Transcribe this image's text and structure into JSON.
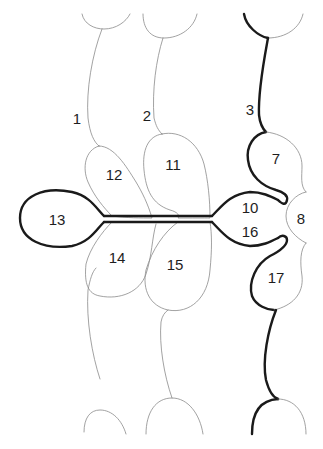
{
  "diagram": {
    "colors": {
      "background": "#ffffff",
      "thin_line": "#8a8a8a",
      "thick_line": "#1a1a1a",
      "label": "#1e1e1e"
    },
    "labels": [
      {
        "id": "1",
        "text": "1",
        "x": 77,
        "y": 118
      },
      {
        "id": "2",
        "text": "2",
        "x": 147,
        "y": 115
      },
      {
        "id": "3",
        "text": "3",
        "x": 250,
        "y": 109
      },
      {
        "id": "7",
        "text": "7",
        "x": 276,
        "y": 158
      },
      {
        "id": "8",
        "text": "8",
        "x": 301,
        "y": 218
      },
      {
        "id": "10",
        "text": "10",
        "x": 250,
        "y": 207
      },
      {
        "id": "11",
        "text": "11",
        "x": 173,
        "y": 164
      },
      {
        "id": "12",
        "text": "12",
        "x": 114,
        "y": 174
      },
      {
        "id": "13",
        "text": "13",
        "x": 57,
        "y": 219
      },
      {
        "id": "14",
        "text": "14",
        "x": 117,
        "y": 257
      },
      {
        "id": "15",
        "text": "15",
        "x": 175,
        "y": 264
      },
      {
        "id": "16",
        "text": "16",
        "x": 250,
        "y": 231
      },
      {
        "id": "17",
        "text": "17",
        "x": 276,
        "y": 277
      }
    ]
  }
}
